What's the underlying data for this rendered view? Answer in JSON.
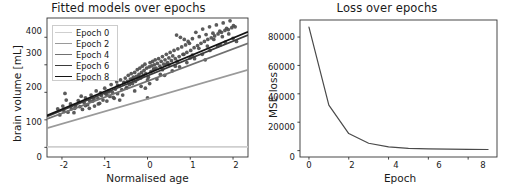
{
  "figure": {
    "background": "#ffffff",
    "width": 514,
    "height": 192
  },
  "chart_data": [
    {
      "type": "scatter",
      "id": "fitted-models",
      "title": "Fitted models over epochs",
      "xlabel": "Normalised age",
      "ylabel": "brain volume [mL]",
      "xlim": [
        -2.35,
        2.35
      ],
      "ylim": [
        -35,
        470
      ],
      "xticks": [
        -2,
        -1,
        0,
        1,
        2
      ],
      "xticklabels": [
        "-2",
        "-1",
        "0",
        "1",
        "2"
      ],
      "yticks": [
        0,
        100,
        200,
        300,
        400
      ],
      "yticklabels": [
        "0",
        "100",
        "200",
        "300",
        "400"
      ],
      "grid": false,
      "legend_position": "upper left",
      "point_color": "#4d4d4d",
      "point_size": 3.0,
      "scatter": {
        "name": "observations",
        "x": [
          -2.1,
          -2.05,
          -1.98,
          -1.95,
          -1.9,
          -1.86,
          -1.8,
          -1.78,
          -1.72,
          -1.68,
          -1.62,
          -1.58,
          -1.52,
          -1.48,
          -1.45,
          -1.4,
          -1.36,
          -1.32,
          -1.28,
          -1.24,
          -1.2,
          -1.16,
          -1.12,
          -1.08,
          -1.04,
          -1.0,
          -0.98,
          -0.95,
          -0.92,
          -0.88,
          -0.85,
          -0.82,
          -0.78,
          -0.75,
          -0.72,
          -0.7,
          -0.66,
          -0.63,
          -0.6,
          -0.58,
          -0.55,
          -0.52,
          -0.5,
          -0.47,
          -0.45,
          -0.42,
          -0.4,
          -0.38,
          -0.35,
          -0.33,
          -0.3,
          -0.28,
          -0.26,
          -0.24,
          -0.22,
          -0.2,
          -0.18,
          -0.16,
          -0.14,
          -0.12,
          -0.1,
          -0.08,
          -0.06,
          -0.04,
          -0.02,
          0.0,
          0.02,
          0.04,
          0.06,
          0.08,
          0.1,
          0.12,
          0.14,
          0.16,
          0.18,
          0.2,
          0.23,
          0.26,
          0.29,
          0.32,
          0.35,
          0.38,
          0.41,
          0.44,
          0.47,
          0.5,
          0.53,
          0.56,
          0.59,
          0.62,
          0.65,
          0.68,
          0.71,
          0.74,
          0.77,
          0.8,
          0.83,
          0.86,
          0.89,
          0.92,
          0.95,
          0.98,
          1.01,
          1.05,
          1.09,
          1.13,
          1.17,
          1.21,
          1.25,
          1.29,
          1.33,
          1.37,
          1.41,
          1.45,
          1.49,
          1.53,
          1.57,
          1.61,
          1.65,
          1.69,
          1.73,
          1.77,
          1.81,
          1.85,
          1.89,
          1.93,
          1.97,
          2.01,
          2.05,
          2.08,
          -1.93,
          -1.55,
          -1.35,
          -1.15,
          -0.95,
          -0.8,
          -0.65,
          -0.48,
          -0.3,
          -0.15,
          0.05,
          0.22,
          0.4,
          0.58,
          0.75,
          0.92,
          1.1,
          1.28,
          1.46,
          1.64,
          1.82,
          2.0,
          -1.7,
          -1.25,
          -0.9,
          -0.55,
          -0.2,
          0.15,
          0.5,
          0.85,
          1.2,
          1.55,
          1.9,
          -1.1,
          -0.7,
          -0.35,
          0.0,
          0.35,
          0.7,
          1.05,
          1.4,
          1.75,
          -0.05,
          0.3,
          0.65,
          1.0,
          1.35,
          1.7,
          -1.45,
          0.45
        ],
        "y": [
          140,
          118,
          150,
          130,
          172,
          128,
          158,
          140,
          126,
          152,
          170,
          148,
          138,
          162,
          180,
          155,
          142,
          190,
          168,
          150,
          205,
          178,
          160,
          188,
          172,
          215,
          195,
          168,
          205,
          185,
          228,
          200,
          178,
          212,
          238,
          195,
          222,
          245,
          210,
          190,
          235,
          252,
          215,
          240,
          262,
          228,
          248,
          268,
          232,
          255,
          272,
          240,
          258,
          282,
          248,
          265,
          288,
          252,
          272,
          295,
          262,
          280,
          302,
          268,
          288,
          245,
          255,
          292,
          308,
          275,
          296,
          312,
          282,
          300,
          318,
          288,
          305,
          322,
          295,
          312,
          330,
          302,
          318,
          338,
          308,
          325,
          345,
          315,
          332,
          352,
          322,
          408,
          358,
          330,
          400,
          365,
          338,
          392,
          372,
          345,
          385,
          378,
          352,
          395,
          362,
          418,
          370,
          402,
          378,
          430,
          385,
          410,
          392,
          438,
          398,
          415,
          405,
          445,
          412,
          422,
          418,
          452,
          425,
          432,
          428,
          460,
          435,
          442,
          438,
          385,
          196,
          186,
          168,
          158,
          192,
          182,
          172,
          218,
          205,
          222,
          232,
          248,
          262,
          278,
          292,
          308,
          322,
          338,
          352,
          368,
          382,
          396,
          142,
          176,
          202,
          236,
          258,
          285,
          300,
          338,
          360,
          392,
          412,
          198,
          225,
          248,
          180,
          282,
          312,
          335,
          368,
          402,
          215,
          265,
          295,
          325,
          318,
          372,
          152,
          302
        ]
      },
      "lines": [
        {
          "label": "Epoch 0",
          "color": "#cfcfcf",
          "y_at_xmin": 2.0,
          "y_at_xmax": 2.0
        },
        {
          "label": "Epoch 2",
          "color": "#9a9a9a",
          "y_at_xmin": 70.0,
          "y_at_xmax": 282.0
        },
        {
          "label": "Epoch 4",
          "color": "#707070",
          "y_at_xmin": 103.0,
          "y_at_xmax": 378.0
        },
        {
          "label": "Epoch 6",
          "color": "#3b3b3b",
          "y_at_xmin": 112.0,
          "y_at_xmax": 408.0
        },
        {
          "label": "Epoch 8",
          "color": "#141414",
          "y_at_xmin": 116.0,
          "y_at_xmax": 420.0
        }
      ],
      "legend_entries": [
        "Epoch 0",
        "Epoch 2",
        "Epoch 4",
        "Epoch 6",
        "Epoch 8"
      ]
    },
    {
      "type": "line",
      "id": "loss-over-epochs",
      "title": "Loss over epochs",
      "xlabel": "Epoch",
      "ylabel": "MSE loss",
      "xlim": [
        -0.45,
        9.45
      ],
      "ylim": [
        -4500,
        92000
      ],
      "xticks": [
        0,
        2,
        4,
        6,
        8
      ],
      "xticklabels": [
        "0",
        "2",
        "4",
        "6",
        "8"
      ],
      "yticks": [
        0,
        20000,
        40000,
        60000,
        80000
      ],
      "yticklabels": [
        "0",
        "20000",
        "40000",
        "60000",
        "80000"
      ],
      "grid": false,
      "line_color": "#4a4a4a",
      "series": [
        {
          "name": "MSE loss",
          "x": [
            0,
            1,
            2,
            3,
            4,
            5,
            6,
            7,
            8,
            9
          ],
          "values": [
            87000,
            32000,
            12000,
            5200,
            2600,
            1600,
            1200,
            1000,
            900,
            800
          ]
        }
      ]
    }
  ]
}
